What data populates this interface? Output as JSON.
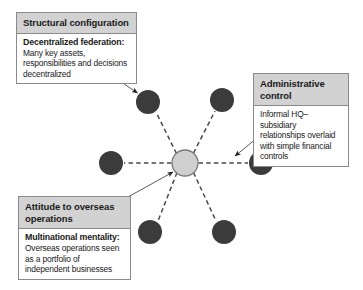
{
  "figure": {
    "colors": {
      "node_fill": "#3b3b3b",
      "hub_fill": "#cfcfcf",
      "hub_stroke": "#7a7a7a",
      "spoke": "#4a4a4a",
      "header_bg": "#d2d2d2",
      "box_border": "#8a8a8a",
      "leader_line": "#5a5a5a",
      "background": "#ffffff"
    }
  },
  "callouts": [
    {
      "id": "structural-configuration",
      "header": "Structural configuration",
      "lead": "Decentralized federation:",
      "detail": "Many key assets, responsibilities and decisions decentralized"
    },
    {
      "id": "administrative-control",
      "header": "Administrative control",
      "lead": "",
      "detail": "Informal HQ–subsidiary relationships overlaid with simple financial controls"
    },
    {
      "id": "attitude-to-overseas-operations",
      "header": "Attitude to overseas operations",
      "lead": "Multinational mentality:",
      "detail": "Overseas operations seen as a portfolio of independent businesses"
    }
  ],
  "network": {
    "hub": {
      "label": "headquarters-hub",
      "cx": 185,
      "cy": 163,
      "r": 13
    },
    "nodes": [
      {
        "label": "subsidiary-node-upper-left",
        "cx": 148,
        "cy": 102,
        "r": 12
      },
      {
        "label": "subsidiary-node-upper-right",
        "cx": 222,
        "cy": 100,
        "r": 12
      },
      {
        "label": "subsidiary-node-left",
        "cx": 111,
        "cy": 163,
        "r": 12
      },
      {
        "label": "subsidiary-node-right",
        "cx": 261,
        "cy": 163,
        "r": 12
      },
      {
        "label": "subsidiary-node-lower-left",
        "cx": 150,
        "cy": 232,
        "r": 12
      },
      {
        "label": "subsidiary-node-lower-right",
        "cx": 224,
        "cy": 232,
        "r": 12
      }
    ]
  }
}
